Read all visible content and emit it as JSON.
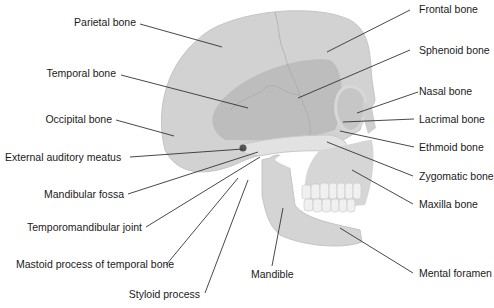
{
  "diagram": {
    "type": "anatomical-labeled-illustration",
    "colors": {
      "bone": "#d4d4d4",
      "bone_dark": "#bdbdbd",
      "bone_light": "#e6e6e6",
      "line": "#333333",
      "text": "#1a1a1a"
    },
    "labels_left": [
      {
        "id": "parietal",
        "text": "Parietal bone"
      },
      {
        "id": "temporal",
        "text": "Temporal bone"
      },
      {
        "id": "occipital",
        "text": "Occipital bone"
      },
      {
        "id": "ext_auditory",
        "text": "External auditory meatus"
      },
      {
        "id": "mand_fossa",
        "text": "Mandibular fossa"
      },
      {
        "id": "tmj",
        "text": "Temporomandibular joint"
      },
      {
        "id": "mastoid",
        "text": "Mastoid process of temporal bone"
      },
      {
        "id": "styloid",
        "text": "Styloid process"
      }
    ],
    "labels_right": [
      {
        "id": "frontal",
        "text": "Frontal bone"
      },
      {
        "id": "sphenoid",
        "text": "Sphenoid bone"
      },
      {
        "id": "nasal",
        "text": "Nasal bone"
      },
      {
        "id": "lacrimal",
        "text": "Lacrimal bone"
      },
      {
        "id": "ethmoid",
        "text": "Ethmoid bone"
      },
      {
        "id": "zygomatic",
        "text": "Zygomatic bone"
      },
      {
        "id": "maxilla",
        "text": "Maxilla bone"
      },
      {
        "id": "mental_foramen",
        "text": "Mental foramen"
      }
    ],
    "labels_bottom": [
      {
        "id": "mandible",
        "text": "Mandible"
      }
    ]
  }
}
